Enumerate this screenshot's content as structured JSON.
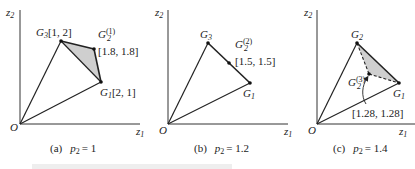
{
  "figure": {
    "panels": [
      {
        "id": "a",
        "caption_tag": "(a)",
        "caption_param": "p",
        "caption_param_sub": "2",
        "caption_value": "= 1",
        "axes": {
          "x_label": "z",
          "x_sub": "1",
          "y_label": "z",
          "y_sub": "2",
          "origin_label": "O"
        },
        "points": [
          {
            "name": "G",
            "sub": "3",
            "sup": "",
            "coord": "[1, 2]"
          },
          {
            "name": "G",
            "sub": "2",
            "sup": "(1)",
            "coord": "[1.8, 1.8]"
          },
          {
            "name": "G",
            "sub": "1",
            "sup": "",
            "coord": "[2, 1]"
          }
        ],
        "shaded_region": "triangle G3-G2(1)-G1"
      },
      {
        "id": "b",
        "caption_tag": "(b)",
        "caption_param": "p",
        "caption_param_sub": "2",
        "caption_value": "= 1.2",
        "axes": {
          "x_label": "z",
          "x_sub": "1",
          "y_label": "z",
          "y_sub": "2",
          "origin_label": "O"
        },
        "points": [
          {
            "name": "G",
            "sub": "3",
            "sup": "",
            "coord": ""
          },
          {
            "name": "G",
            "sub": "2",
            "sup": "(2)",
            "coord": "[1.5, 1.5]"
          },
          {
            "name": "G",
            "sub": "1",
            "sup": "",
            "coord": ""
          }
        ]
      },
      {
        "id": "c",
        "caption_tag": "(c)",
        "caption_param": "p",
        "caption_param_sub": "2",
        "caption_value": "= 1.4",
        "axes": {
          "x_label": "z",
          "x_sub": "1",
          "y_label": "z",
          "y_sub": "2",
          "origin_label": "O"
        },
        "points": [
          {
            "name": "G",
            "sub": "2",
            "sup": "",
            "coord": ""
          },
          {
            "name": "G",
            "sub": "2",
            "sup": "(3)",
            "coord": "[1.28, 1.28]"
          },
          {
            "name": "G",
            "sub": "1",
            "sup": "",
            "coord": ""
          }
        ],
        "shaded_region": "triangle G2-G2(3)-G1",
        "dashed_edges": [
          "G2-G2(3)",
          "G2(3)-G1"
        ]
      }
    ],
    "colors": {
      "line": "#222222",
      "shade": "#cfcfcf",
      "background": "#ffffff"
    }
  }
}
